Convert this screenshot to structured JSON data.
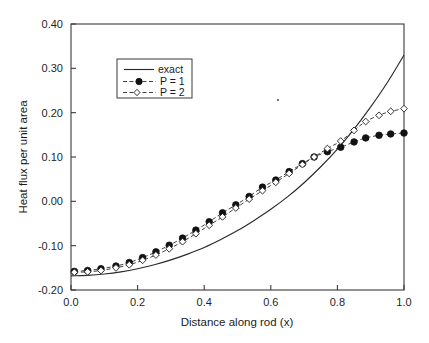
{
  "chart_data": {
    "type": "line",
    "title": "",
    "xlabel": "Distance along rod (x)",
    "ylabel": "Heat flux per unit area",
    "xlim": [
      0.0,
      1.0
    ],
    "ylim": [
      -0.2,
      0.4
    ],
    "xticks": [
      "0.0",
      "0.2",
      "0.4",
      "0.6",
      "0.8",
      "1.0"
    ],
    "xtick_values": [
      0.0,
      0.2,
      0.4,
      0.6,
      0.8,
      1.0
    ],
    "yticks": [
      "-0.20",
      "-0.10",
      "0.00",
      "0.10",
      "0.20",
      "0.30",
      "0.40"
    ],
    "ytick_values": [
      -0.2,
      -0.1,
      0.0,
      0.1,
      0.2,
      0.3,
      0.4
    ],
    "grid": false,
    "legend_position": "upper left",
    "legend_entries": [
      "exact",
      "P = 1",
      "P = 2"
    ],
    "series": [
      {
        "name": "exact",
        "style": "solid-line",
        "marker": "none",
        "x": [
          0.0,
          0.05,
          0.1,
          0.15,
          0.2,
          0.25,
          0.3,
          0.35,
          0.4,
          0.45,
          0.5,
          0.55,
          0.6,
          0.65,
          0.7,
          0.75,
          0.8,
          0.85,
          0.9,
          0.95,
          1.0
        ],
        "y": [
          -0.168,
          -0.167,
          -0.164,
          -0.159,
          -0.152,
          -0.143,
          -0.132,
          -0.119,
          -0.104,
          -0.086,
          -0.066,
          -0.043,
          -0.018,
          0.01,
          0.042,
          0.078,
          0.118,
          0.163,
          0.213,
          0.268,
          0.33
        ]
      },
      {
        "name": "P = 1",
        "style": "dashed-line",
        "marker": "filled-circle",
        "x": [
          0.01,
          0.05,
          0.09,
          0.135,
          0.175,
          0.215,
          0.255,
          0.295,
          0.335,
          0.375,
          0.415,
          0.455,
          0.495,
          0.535,
          0.575,
          0.615,
          0.655,
          0.695,
          0.73,
          0.77,
          0.81,
          0.85,
          0.885,
          0.925,
          0.96,
          1.0
        ],
        "y": [
          -0.158,
          -0.156,
          -0.152,
          -0.146,
          -0.138,
          -0.127,
          -0.114,
          -0.099,
          -0.083,
          -0.065,
          -0.046,
          -0.026,
          -0.008,
          0.011,
          0.032,
          0.048,
          0.067,
          0.085,
          0.1,
          0.112,
          0.122,
          0.134,
          0.143,
          0.149,
          0.152,
          0.154
        ]
      },
      {
        "name": "P = 2",
        "style": "dashed-line",
        "marker": "open-diamond",
        "x": [
          0.01,
          0.05,
          0.09,
          0.135,
          0.175,
          0.215,
          0.255,
          0.295,
          0.335,
          0.375,
          0.415,
          0.455,
          0.495,
          0.535,
          0.575,
          0.615,
          0.655,
          0.695,
          0.73,
          0.77,
          0.81,
          0.85,
          0.885,
          0.925,
          0.96,
          1.0
        ],
        "y": [
          -0.16,
          -0.159,
          -0.156,
          -0.15,
          -0.143,
          -0.133,
          -0.121,
          -0.107,
          -0.091,
          -0.073,
          -0.054,
          -0.035,
          -0.015,
          0.005,
          0.024,
          0.043,
          0.063,
          0.083,
          0.1,
          0.119,
          0.136,
          0.16,
          0.18,
          0.194,
          0.203,
          0.209
        ]
      }
    ]
  }
}
